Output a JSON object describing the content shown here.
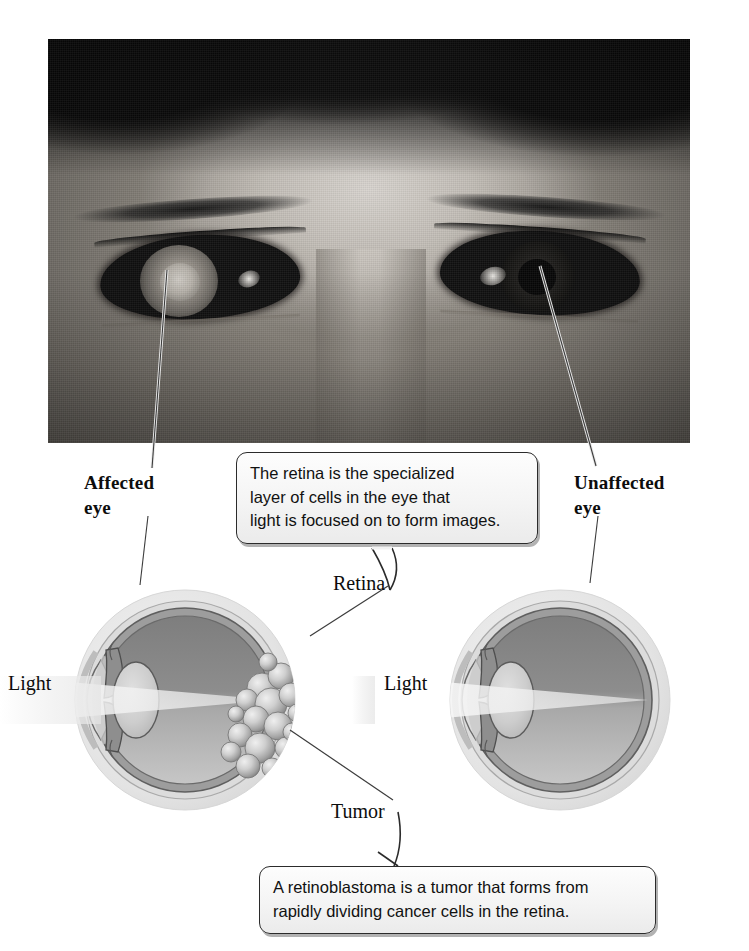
{
  "figure": {
    "subject": "retinoblastoma",
    "photo_alt": "Grayscale photograph of a child's face showing leukocoria (white pupil reflex) in the affected left eye"
  },
  "labels": {
    "affected_eye": "Affected\neye",
    "unaffected_eye": "Unaffected\neye",
    "retina": "Retina",
    "tumor": "Tumor",
    "light_left": "Light",
    "light_right": "Light"
  },
  "callouts": [
    {
      "id": "retina-callout",
      "text": "The retina is the specialized\nlayer of cells in the eye that\nlight is focused on to form images."
    },
    {
      "id": "tumor-callout",
      "text": "A retinoblastoma is a tumor that forms from\nrapidly dividing cancer cells in the retina."
    }
  ],
  "diagrams": [
    {
      "id": "affected-eye-diagram",
      "name": "Affected eye",
      "has_tumor": true,
      "light_label": "Light"
    },
    {
      "id": "unaffected-eye-diagram",
      "name": "Unaffected eye",
      "has_tumor": false,
      "light_label": "Light"
    }
  ],
  "colors": {
    "sclera_outer": "#e8e8e8",
    "sclera_ring": "#c9c9c9",
    "choroid": "#9a9a9a",
    "vitreous_upper": "#8a8a8a",
    "vitreous_lower": "#b5b5b5",
    "lens": "#cfcfcf",
    "tumor_light": "#dcdcdc",
    "tumor_shadow": "#8f8f8f",
    "outline": "#3a3a3a",
    "callout_border": "#2b2b2b",
    "callout_fill": "#f5f5f5",
    "text": "#111111",
    "leader_line": "#4a4a4a"
  }
}
